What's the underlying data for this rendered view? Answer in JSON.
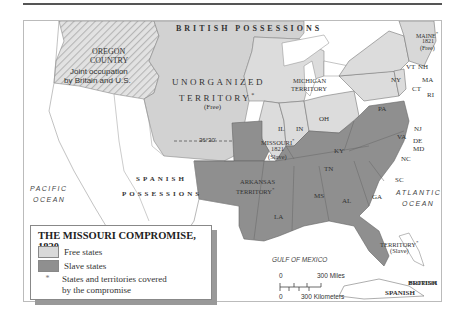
{
  "map": {
    "title": "THE MISSOURI COMPROMISE, 1820",
    "colors": {
      "free": "#d9d9d9",
      "slave": "#8f8f8f",
      "unorganized": "#cfcfcf",
      "oregon_hatch": "#c8c8c8",
      "foreign": "#ffffff",
      "water": "#ffffff",
      "border": "#666666"
    },
    "regions": {
      "british_possessions": "BRITISH POSSESSIONS",
      "oregon": {
        "name_line1": "OREGON",
        "name_line2": "COUNTRY",
        "note_line1": "Joint occupation",
        "note_line2": "by Britain and U.S."
      },
      "unorganized": {
        "line1": "UNORGANIZED",
        "line2": "TERRITORY",
        "marker": "*",
        "status": "(Free)"
      },
      "michigan": {
        "line1": "MICHIGAN",
        "line2": "TERRITORY"
      },
      "missouri": {
        "line1": "MISSOURI",
        "marker": "*",
        "year": "1821",
        "status": "(Slave)"
      },
      "arkansas": {
        "line1": "ARKANSAS",
        "line2": "TERRITORY",
        "marker": "*"
      },
      "spanish_possessions": {
        "line1": "SPANISH",
        "line2": "POSSESSIONS"
      },
      "florida": {
        "line1": "FLORIDA",
        "line2": "TERRITORY",
        "marker": "*",
        "status": "(Slave)"
      },
      "maine": {
        "line1": "MAINE",
        "marker": "*",
        "year": "1821",
        "status": "(Free)"
      },
      "british_islands": "BRITISH",
      "spanish_cuba": "SPANISH",
      "latitude": "36°30'"
    },
    "states": [
      "IL",
      "IN",
      "OH",
      "KY",
      "TN",
      "VA",
      "NC",
      "SC",
      "GA",
      "AL",
      "MS",
      "LA",
      "PA",
      "NY",
      "NJ",
      "DE",
      "MD",
      "VT",
      "NH",
      "MA",
      "CT",
      "RI"
    ],
    "water": {
      "pacific_line1": "PACIFIC",
      "pacific_line2": "OCEAN",
      "atlantic_line1": "ATLANTIC",
      "atlantic_line2": "OCEAN",
      "gulf": "GULF OF MEXICO"
    },
    "scale": {
      "zero": "0",
      "miles": "300 Miles",
      "km": "300 Kilometers"
    }
  },
  "legend": {
    "title": "THE MISSOURI COMPROMISE, 1820",
    "items": [
      {
        "label": "Free states",
        "color": "#d9d9d9"
      },
      {
        "label": "Slave states",
        "color": "#8f8f8f"
      },
      {
        "label_line1": "States and territories covered",
        "label_line2": "by the compromise",
        "symbol": "*"
      }
    ]
  }
}
